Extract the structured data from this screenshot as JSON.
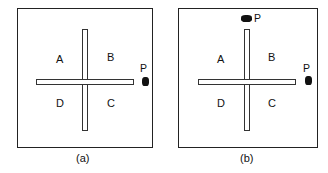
{
  "figure": {
    "panels": [
      {
        "id": "a",
        "caption": "(a)",
        "quadrants": [
          "A",
          "B",
          "D",
          "C"
        ],
        "platform_label": "P",
        "platforms": [
          "east-arm-end"
        ]
      },
      {
        "id": "b",
        "caption": "(b)",
        "quadrants": [
          "A",
          "B",
          "D",
          "C"
        ],
        "platform_label": "P",
        "platforms": [
          "north-arm-end",
          "east-arm-end"
        ]
      }
    ]
  }
}
